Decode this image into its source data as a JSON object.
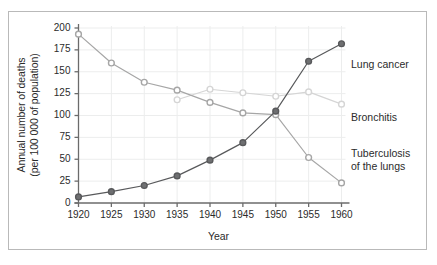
{
  "chart_data": {
    "type": "line",
    "title": "",
    "xlabel": "Year",
    "ylabel": "Annual number of deaths\n(per 100 000 of population)",
    "x": [
      1920,
      1925,
      1930,
      1935,
      1940,
      1945,
      1950,
      1955,
      1960
    ],
    "xtick_labels": [
      "1920",
      "1925",
      "1930",
      "1935",
      "1940",
      "1945",
      "1950",
      "1955",
      "1960"
    ],
    "ytick_labels": [
      "200",
      "175",
      "150",
      "125",
      "100",
      "75",
      "50",
      "25",
      "0"
    ],
    "yticks": [
      200,
      175,
      150,
      125,
      100,
      75,
      50,
      25,
      0
    ],
    "xlim": [
      1920,
      1960
    ],
    "ylim": [
      0,
      200
    ],
    "grid": true,
    "legend_position": "right-inline-labels",
    "series": [
      {
        "name": "Lung cancer",
        "color": "#58595b",
        "marker": "filled-circle",
        "x": [
          1920,
          1925,
          1930,
          1935,
          1940,
          1945,
          1950,
          1955,
          1960
        ],
        "values": [
          7,
          13,
          20,
          31,
          49,
          69,
          105,
          162,
          182
        ]
      },
      {
        "name": "Bronchitis",
        "color": "#d5d5d5",
        "marker": "open-circle",
        "x": [
          1935,
          1940,
          1945,
          1950,
          1955,
          1960
        ],
        "values": [
          118,
          130,
          126,
          122,
          127,
          113
        ]
      },
      {
        "name": "Tuberculosis of the lungs",
        "color": "#a6a6a6",
        "marker": "open-circle",
        "x": [
          1920,
          1925,
          1930,
          1935,
          1940,
          1945,
          1950,
          1955,
          1960
        ],
        "values": [
          193,
          160,
          138,
          129,
          115,
          103,
          101,
          52,
          23
        ]
      }
    ],
    "annotations": [
      {
        "text": "Lung cancer",
        "anchor_x": 1960,
        "anchor_y": 170
      },
      {
        "text": "Bronchitis",
        "anchor_x": 1960,
        "anchor_y": 108
      },
      {
        "text": "Tuberculosis\nof the lungs",
        "anchor_x": 1960,
        "anchor_y": 60
      }
    ],
    "colors": {
      "axis": "#6b6b6b",
      "grid": "#eceded",
      "text": "#2b2b2b",
      "frame": "#b9b9b9",
      "background": "#ffffff"
    }
  }
}
